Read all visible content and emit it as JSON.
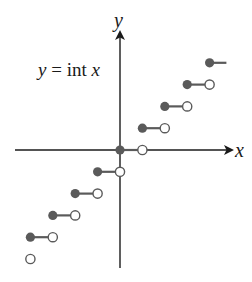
{
  "chart_data": {
    "type": "line",
    "subtype": "step-function",
    "title": "",
    "function_label": "y = int x",
    "function_label_parts": {
      "lhs": "y",
      "eq": "=",
      "fn": "int",
      "arg": "x"
    },
    "xlabel": "x",
    "ylabel": "y",
    "grid": false,
    "ticks_shown": false,
    "xlim": [
      -4.3,
      5
    ],
    "ylim": [
      -5.3,
      4.2
    ],
    "series": [
      {
        "name": "int x",
        "segments": [
          {
            "x_start": -4,
            "x_end": -3,
            "y": -4,
            "closed_left": true,
            "open_right": true
          },
          {
            "x_start": -3,
            "x_end": -2,
            "y": -3,
            "closed_left": true,
            "open_right": true
          },
          {
            "x_start": -2,
            "x_end": -1,
            "y": -2,
            "closed_left": true,
            "open_right": true
          },
          {
            "x_start": -1,
            "x_end": 0,
            "y": -1,
            "closed_left": true,
            "open_right": true
          },
          {
            "x_start": 0,
            "x_end": 1,
            "y": 0,
            "closed_left": true,
            "open_right": true
          },
          {
            "x_start": 1,
            "x_end": 2,
            "y": 1,
            "closed_left": true,
            "open_right": true
          },
          {
            "x_start": 2,
            "x_end": 3,
            "y": 2,
            "closed_left": true,
            "open_right": true
          },
          {
            "x_start": 3,
            "x_end": 4,
            "y": 3,
            "closed_left": true,
            "open_right": true
          },
          {
            "x_start": 4,
            "x_end": 4.75,
            "y": 4,
            "closed_left": true,
            "open_right": false
          }
        ],
        "extra_open_points": [
          {
            "x": -4,
            "y": -5
          }
        ]
      }
    ],
    "colors": {
      "axis": "#1a1a1a",
      "filled_dot": "#5a5a5a",
      "segment": "#5a5a5a",
      "open_dot_stroke": "#5a5a5a",
      "open_dot_fill": "#ffffff"
    }
  },
  "labels": {
    "function": {
      "lhs": "y",
      "eq": " = ",
      "fn": "int ",
      "arg": "x"
    },
    "x_axis": "x",
    "y_axis": "y"
  }
}
